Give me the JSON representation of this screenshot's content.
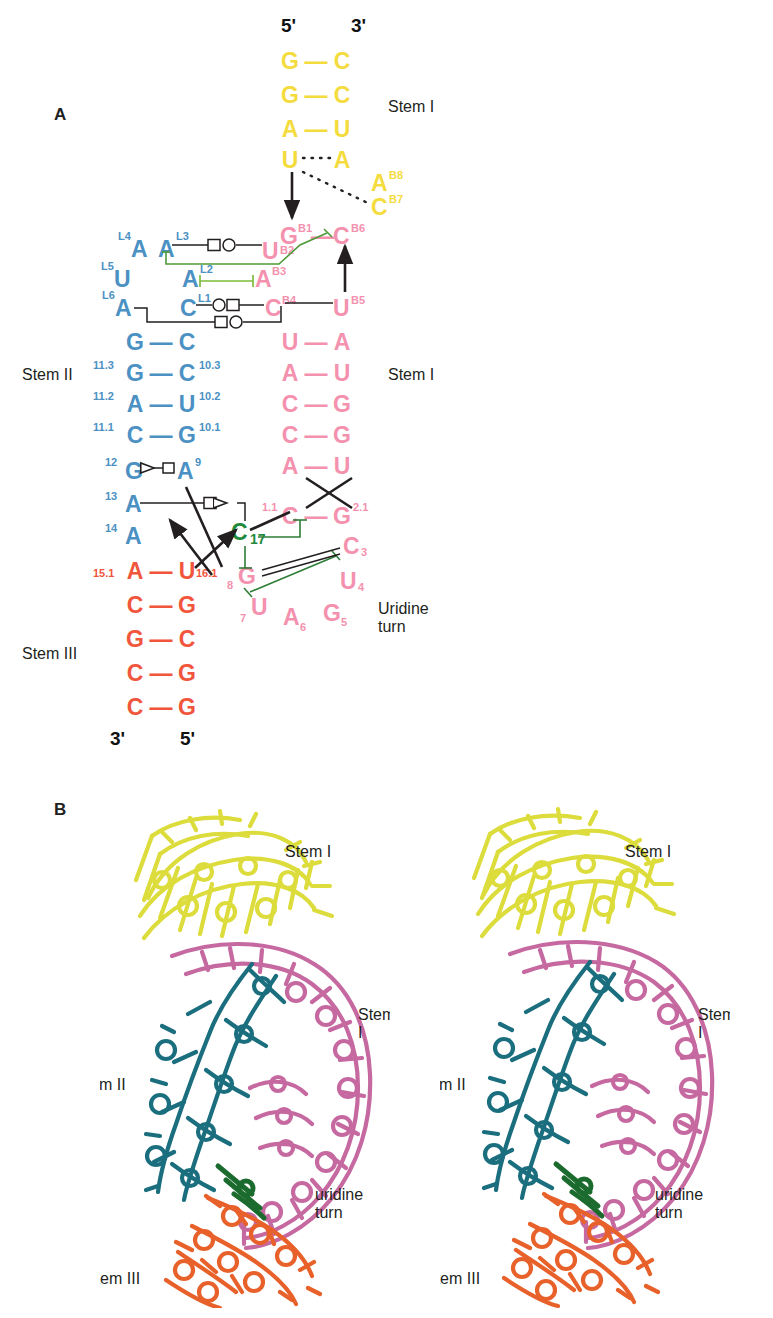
{
  "figure": {
    "panels": [
      {
        "id": "A",
        "label": "A"
      },
      {
        "id": "B",
        "label": "B"
      }
    ]
  },
  "panel_a": {
    "letter": "A",
    "termini": {
      "top_5prime": "5'",
      "top_3prime": "3'",
      "bottom_3prime": "3'",
      "bottom_5prime": "5'"
    },
    "region_labels": {
      "stem_i_top": "Stem I",
      "stem_i_right": "Stem I",
      "stem_ii": "Stem II",
      "stem_iii": "Stem III",
      "uridine_turn": "Uridine\nturn"
    },
    "colors": {
      "yellow": "#F4DC3E",
      "pink": "#F491AE",
      "blue": "#4C91C3",
      "orange": "#F1563D",
      "green": "#1F8A3B",
      "black": "#231f20"
    },
    "stem_i_top_pairs": [
      {
        "left": "G",
        "right": "C",
        "bond": "—"
      },
      {
        "left": "G",
        "right": "C",
        "bond": "—"
      },
      {
        "left": "A",
        "right": "U",
        "bond": "—"
      },
      {
        "left": "U",
        "right": "A",
        "bond": "····"
      }
    ],
    "yellow_bulge": [
      {
        "base": "A",
        "number": "B8"
      },
      {
        "base": "C",
        "number": "B7"
      }
    ],
    "pink_loop_top": [
      {
        "base": "G",
        "number": "B1"
      },
      {
        "base": "C",
        "number": "B6"
      },
      {
        "base": "U",
        "number": "B2"
      },
      {
        "base": "A",
        "number": "B3"
      },
      {
        "base": "C",
        "number": "B4"
      },
      {
        "base": "U",
        "number": "B5"
      }
    ],
    "blue_loop": [
      {
        "base": "A",
        "number": "L4"
      },
      {
        "base": "A",
        "number": "L3"
      },
      {
        "base": "U",
        "number": "L5"
      },
      {
        "base": "A",
        "number": "L2"
      },
      {
        "base": "A",
        "number": "L6"
      },
      {
        "base": "C",
        "number": "L1"
      }
    ],
    "stem_i_right_pairs": [
      {
        "left": "U",
        "right": "A",
        "bond": "—"
      },
      {
        "left": "A",
        "right": "U",
        "bond": "—"
      },
      {
        "left": "C",
        "right": "G",
        "bond": "—"
      },
      {
        "left": "C",
        "right": "G",
        "bond": "—"
      },
      {
        "left": "A",
        "right": "U",
        "bond": "—"
      }
    ],
    "stem_i_closing_pair": {
      "left": "C",
      "left_num": "1.1",
      "right": "G",
      "right_num": "2.1",
      "bond": "—"
    },
    "stem_ii_pairs": [
      {
        "left": "G",
        "right": "C",
        "bond": "—",
        "left_num": "",
        "right_num": ""
      },
      {
        "left": "G",
        "right": "C",
        "bond": "—",
        "left_num": "11.3",
        "right_num": "10.3"
      },
      {
        "left": "A",
        "right": "U",
        "bond": "—",
        "left_num": "11.2",
        "right_num": "10.2"
      },
      {
        "left": "C",
        "right": "G",
        "bond": "—",
        "left_num": "11.1",
        "right_num": "10.1"
      }
    ],
    "stem_ii_unpaired": [
      {
        "base": "G",
        "number": "12"
      },
      {
        "base": "A",
        "number": "9"
      },
      {
        "base": "A",
        "number": "13"
      },
      {
        "base": "A",
        "number": "14"
      }
    ],
    "stem_iii_pairs": [
      {
        "left": "A",
        "right": "U",
        "bond": "—",
        "left_num": "15.1",
        "right_num": "16.1"
      },
      {
        "left": "C",
        "right": "G",
        "bond": "—",
        "left_num": "",
        "right_num": ""
      },
      {
        "left": "G",
        "right": "C",
        "bond": "—",
        "left_num": "",
        "right_num": ""
      },
      {
        "left": "C",
        "right": "G",
        "bond": "—",
        "left_num": "",
        "right_num": ""
      },
      {
        "left": "C",
        "right": "G",
        "bond": "—",
        "left_num": "",
        "right_num": ""
      }
    ],
    "catalytic_core": [
      {
        "base": "C",
        "number": "17",
        "color": "green"
      },
      {
        "base": "G",
        "number": "8",
        "color": "pink"
      },
      {
        "base": "U",
        "number": "7",
        "color": "pink"
      },
      {
        "base": "A",
        "number": "6",
        "color": "pink"
      },
      {
        "base": "G",
        "number": "5",
        "color": "pink"
      },
      {
        "base": "U",
        "number": "4",
        "color": "pink"
      },
      {
        "base": "C",
        "number": "3",
        "color": "pink"
      }
    ]
  },
  "panel_b": {
    "letter": "B",
    "left_view": {
      "labels": {
        "stem_i_top": "Stem I",
        "stem_i_right": "Stem I",
        "stem_ii": "Stem II",
        "stem_iii": "Stem III",
        "uridine_turn": "uridine\nturn"
      }
    },
    "right_view": {
      "labels": {
        "stem_i_top": "Stem I",
        "stem_i_right": "Stem I",
        "stem_ii": "Stem II",
        "stem_iii": "Stem III",
        "uridine_turn": "uridine\nturn"
      }
    },
    "colors": {
      "stem_i_yellow": "#DCDC3C",
      "stem_i_pink": "#C569A0",
      "stem_ii_teal": "#1B6E7E",
      "stem_iii_orange": "#E8602A",
      "core_green": "#1C6B2E"
    }
  }
}
